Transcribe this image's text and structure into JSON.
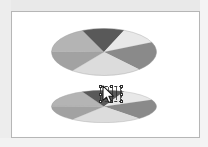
{
  "window": {
    "title": "Pie Chart Resize",
    "background_color": "#ffffff",
    "frame_border_color": "#b6b6b6",
    "gutter_color": "#ececec"
  },
  "chart_data": [
    {
      "id": "pie-top",
      "type": "pie",
      "title": "",
      "subtitle": "",
      "xlabel": "",
      "ylabel": "",
      "legend": "none",
      "grid": false,
      "view": "3d-elliptical",
      "aspect_note": "Full height ellipse, unmodified pie",
      "center_x_pct": 50,
      "center_y_pct": 50,
      "radius_x_pct": 50,
      "radius_y_pct": 50,
      "categories": [
        "Segment A",
        "Segment B",
        "Segment C",
        "Segment D",
        "Segment E",
        "Segment F"
      ],
      "values": [
        18,
        13,
        12,
        20,
        22,
        15
      ],
      "start_angle_deg": 181,
      "colors": [
        "#b4b4b4",
        "#595959",
        "#e8e8e8",
        "#8a8a8a",
        "#dcdcdc",
        "#a2a2a2"
      ],
      "slice_labels": [
        "Segment A 18%",
        "Segment B 13%",
        "Segment C 12%",
        "Segment D 20%",
        "Segment E 22%",
        "Segment F 15%"
      ],
      "edge_color": "#9a9a9a",
      "show_data_labels": false
    },
    {
      "id": "pie-bottom",
      "type": "pie",
      "title": "",
      "subtitle": "",
      "xlabel": "",
      "ylabel": "",
      "legend": "none",
      "grid": false,
      "view": "3d-elliptical",
      "aspect_note": "Same pie vertically squashed while being resized",
      "center_x_pct": 50,
      "center_y_pct": 50,
      "radius_x_pct": 50,
      "radius_y_pct": 50,
      "categories": [
        "Segment A",
        "Segment B",
        "Segment C",
        "Segment D",
        "Segment E",
        "Segment F"
      ],
      "values": [
        18,
        13,
        12,
        20,
        22,
        15
      ],
      "start_angle_deg": 181,
      "colors": [
        "#b4b4b4",
        "#595959",
        "#e8e8e8",
        "#8a8a8a",
        "#dcdcdc",
        "#a2a2a2"
      ],
      "slice_labels": [
        "Segment A 18%",
        "Segment B 13%",
        "Segment C 12%",
        "Segment D 20%",
        "Segment E 22%",
        "Segment F 15%"
      ],
      "edge_color": "#9a9a9a",
      "show_data_labels": false
    }
  ],
  "selection": {
    "state": "resizing",
    "handle_count": 8,
    "handle_fill": "#ffffff",
    "handle_stroke": "#2d2d2d",
    "marquee_style": "dashed",
    "marquee_color": "#3a3a3a"
  },
  "cursor": {
    "type": "arrow",
    "x": 101,
    "y": 84,
    "fill": "#ffffff",
    "stroke": "#1a1a1a"
  }
}
